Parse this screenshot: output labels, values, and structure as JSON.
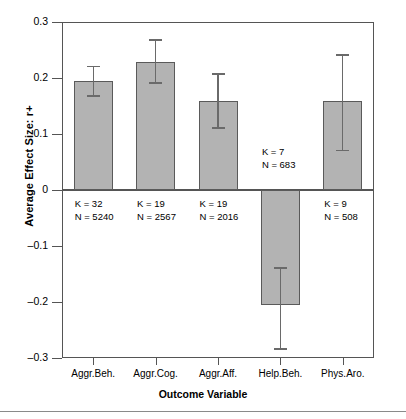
{
  "chart_data": {
    "type": "bar",
    "title": "",
    "xlabel": "Outcome Variable",
    "ylabel": "Average Effect Size: r+",
    "categories": [
      "Aggr.Beh.",
      "Aggr.Cog.",
      "Aggr.Aff.",
      "Help.Beh.",
      "Phys.Aro."
    ],
    "values": [
      0.195,
      0.229,
      0.159,
      -0.205,
      0.159
    ],
    "error_low": [
      0.168,
      0.191,
      0.111,
      -0.284,
      0.071
    ],
    "error_high": [
      0.221,
      0.268,
      0.207,
      -0.139,
      0.241
    ],
    "ylim": [
      -0.3,
      0.3
    ],
    "yticks": [
      0.3,
      0.2,
      0.1,
      0,
      -0.1,
      -0.2,
      -0.3
    ],
    "ytick_labels": [
      "0.3",
      "0.2",
      "0.1",
      "0",
      "–0.1",
      "–0.2",
      "–0.3"
    ],
    "grid": false,
    "legend": "none",
    "bar_color": "#b3b3b3",
    "bar_edge_color": "#5a5a5a",
    "error_color": "#6a6a6a",
    "annotations": [
      {
        "k": "K = 32",
        "n": "N = 5240"
      },
      {
        "k": "K = 19",
        "n": "N = 2567"
      },
      {
        "k": "K = 19",
        "n": "N = 2016"
      },
      {
        "k": "K = 7",
        "n": "N = 683"
      },
      {
        "k": "K = 9",
        "n": "N = 508"
      }
    ]
  }
}
